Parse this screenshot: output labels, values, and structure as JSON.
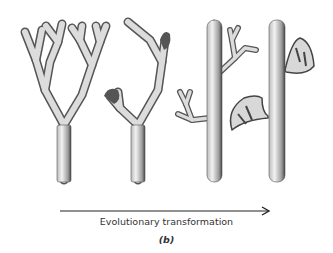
{
  "figure": {
    "stages": [
      {
        "id": "stage-1",
        "description": "dichotomously branching axis, equal branches"
      },
      {
        "id": "stage-2",
        "description": "overtopping: one branch dominant, lateral branch reduced"
      },
      {
        "id": "stage-3",
        "description": "main axis with lateral branch systems"
      },
      {
        "id": "stage-4",
        "description": "main axis with webbed lateral branches forming leaves"
      }
    ],
    "arrow": {
      "direction": "right"
    },
    "caption": "Evolutionary transformation",
    "label": "(b)"
  }
}
